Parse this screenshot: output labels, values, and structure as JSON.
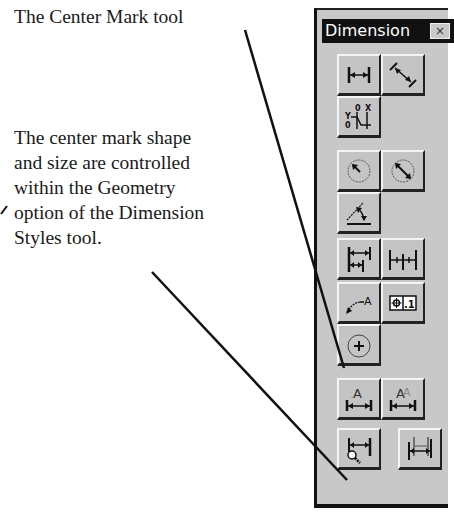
{
  "annotations": {
    "caption_tool": "The Center Mark tool",
    "caption_geometry_lines": [
      "The center mark shape",
      "and size are controlled",
      "within the Geometry",
      "option of the Dimension",
      "Styles tool."
    ]
  },
  "toolbar": {
    "title": "Dimension",
    "close_glyph": "×",
    "buttons": [
      {
        "name": "linear-dimension",
        "icon": "linear-dimension-icon"
      },
      {
        "name": "aligned-dimension",
        "icon": "aligned-dimension-icon"
      },
      {
        "name": "ordinate-dimension",
        "icon": "ordinate-dimension-icon"
      },
      {
        "name": "radius-dimension",
        "icon": "radius-dimension-icon"
      },
      {
        "name": "diameter-dimension",
        "icon": "diameter-dimension-icon"
      },
      {
        "name": "angular-dimension",
        "icon": "angular-dimension-icon"
      },
      {
        "name": "baseline-dimension",
        "icon": "baseline-dimension-icon"
      },
      {
        "name": "continue-dimension",
        "icon": "continue-dimension-icon"
      },
      {
        "name": "leader",
        "icon": "leader-icon"
      },
      {
        "name": "tolerance",
        "icon": "tolerance-icon",
        "label": ".1"
      },
      {
        "name": "center-mark",
        "icon": "center-mark-icon"
      },
      {
        "name": "dimension-edit",
        "icon": "dimension-edit-icon"
      },
      {
        "name": "dimension-text-edit",
        "icon": "dimension-text-edit-icon"
      },
      {
        "name": "dimension-style",
        "icon": "dimension-style-icon"
      },
      {
        "name": "dimension-update",
        "icon": "dimension-update-icon"
      }
    ]
  },
  "colors": {
    "toolbar_bg": "#c8c8c8",
    "titlebar_bg": "#111111",
    "text": "#1a1a1a"
  }
}
